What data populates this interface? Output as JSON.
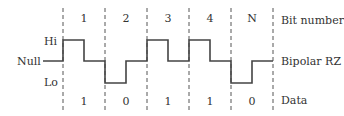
{
  "labels": {
    "hi": "Hi",
    "null": "Null",
    "lo": "Lo",
    "bit_number": "Bit number",
    "bipolar_rz": "Bipolar RZ",
    "data": "Data"
  },
  "bits": [
    {
      "number": "1",
      "data": "1"
    },
    {
      "number": "2",
      "data": "0"
    },
    {
      "number": "3",
      "data": "1"
    },
    {
      "number": "4",
      "data": "1"
    },
    {
      "number": "N",
      "data": "0"
    }
  ]
}
